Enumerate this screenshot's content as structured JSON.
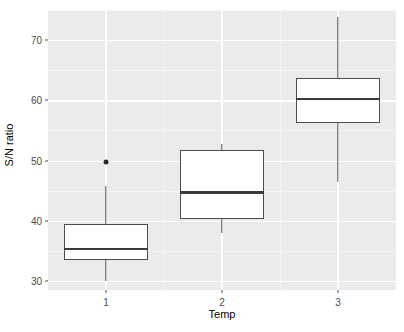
{
  "chart_data": {
    "type": "box",
    "title": "",
    "xlabel": "Temp",
    "ylabel": "S/N ratio",
    "categories": [
      "1",
      "2",
      "3"
    ],
    "xtick_labels": [
      "1",
      "2",
      "3"
    ],
    "ytick_labels": [
      "30",
      "40",
      "50",
      "60",
      "70"
    ],
    "ytick_values": [
      30,
      40,
      50,
      60,
      70
    ],
    "ylim": [
      28.5,
      75.0
    ],
    "grid": true,
    "legend": "none",
    "panel_background": "#ebebeb",
    "grid_major_color": "#ffffff",
    "grid_minor_color": "#f5f5f5",
    "box_fill": "#ffffff",
    "box_stroke": "#4d4d4d",
    "median_color": "#3b3b3b",
    "outlier_color": "#2b2b2b",
    "boxes": [
      {
        "category": "1",
        "whisker_low": 30.0,
        "q1": 33.5,
        "median": 35.3,
        "q3": 39.5,
        "whisker_high": 45.7,
        "outliers": [
          49.8
        ]
      },
      {
        "category": "2",
        "whisker_low": 38.0,
        "q1": 40.3,
        "median": 44.7,
        "q3": 51.7,
        "whisker_high": 52.8,
        "outliers": []
      },
      {
        "category": "3",
        "whisker_low": 46.5,
        "q1": 56.3,
        "median": 60.2,
        "q3": 63.7,
        "whisker_high": 73.8,
        "outliers": []
      }
    ]
  }
}
